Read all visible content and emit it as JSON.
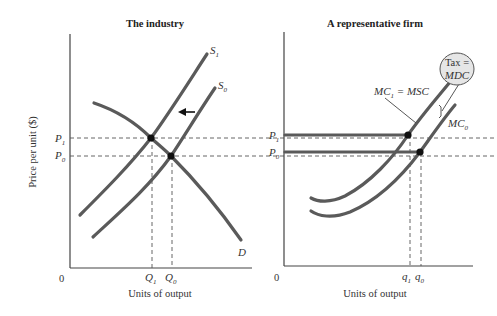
{
  "left_panel": {
    "title": "The industry",
    "y_axis_label": "Price per unit ($)",
    "x_axis_label": "Units of output",
    "origin_label": "0",
    "price_labels": [
      {
        "main": "P",
        "sub": "1"
      },
      {
        "main": "P",
        "sub": "0"
      }
    ],
    "quantity_labels": [
      {
        "main": "Q",
        "sub": "1"
      },
      {
        "main": "Q",
        "sub": "0"
      }
    ],
    "curves": [
      {
        "main": "S",
        "sub": "1"
      },
      {
        "main": "S",
        "sub": "0"
      },
      {
        "main": "D",
        "sub": ""
      }
    ],
    "shift_arrow": "left"
  },
  "right_panel": {
    "title": "A representative firm",
    "x_axis_label": "Units of output",
    "origin_label": "0",
    "price_labels": [
      {
        "main": "P",
        "sub": "1"
      },
      {
        "main": "P",
        "sub": "0"
      }
    ],
    "quantity_labels": [
      {
        "main": "q",
        "sub": "1"
      },
      {
        "main": "q",
        "sub": "0"
      }
    ],
    "mc1_label": {
      "main": "MC",
      "sub": "1",
      "rest": " = MSC"
    },
    "mc0_label": {
      "main": "MC",
      "sub": "0"
    },
    "tax_bubble": {
      "line1": "Tax =",
      "line2": "MDC"
    }
  },
  "colors": {
    "curve": "#5a5a5a",
    "axis": "#444444",
    "bubble_fill": "#e6e6e6"
  }
}
